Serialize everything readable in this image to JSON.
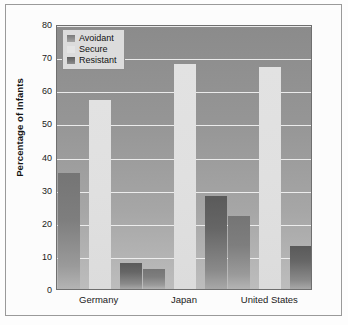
{
  "chart_data": {
    "type": "bar",
    "title": "",
    "xlabel": "",
    "ylabel": "Percentage of Infants",
    "ylim": [
      0,
      80
    ],
    "ytick_labels": [
      "80",
      "70",
      "60",
      "50",
      "40",
      "30",
      "20",
      "10",
      "0"
    ],
    "ytick_values": [
      80,
      70,
      60,
      50,
      40,
      30,
      20,
      10,
      0
    ],
    "grid": true,
    "legend_position": "top-left",
    "categories": [
      "Germany",
      "Japan",
      "United States"
    ],
    "series": [
      {
        "name": "Avoidant",
        "color": "#8a8a8a",
        "values": [
          35,
          6,
          22
        ]
      },
      {
        "name": "Secure",
        "color": "#e0e0e0",
        "values": [
          57,
          68,
          67
        ]
      },
      {
        "name": "Resistant",
        "color": "#6a6a6a",
        "values": [
          8,
          28,
          13
        ]
      }
    ]
  },
  "legend": {
    "items": [
      {
        "label": "Avoidant"
      },
      {
        "label": "Secure"
      },
      {
        "label": "Resistant"
      }
    ]
  },
  "colors": {
    "plot_background_top": "#8b8b8b",
    "plot_background_bottom": "#bdbdbd",
    "gridline": "#f2f2f2",
    "frame": "#9a9a9a",
    "text": "#1a1a1a"
  }
}
